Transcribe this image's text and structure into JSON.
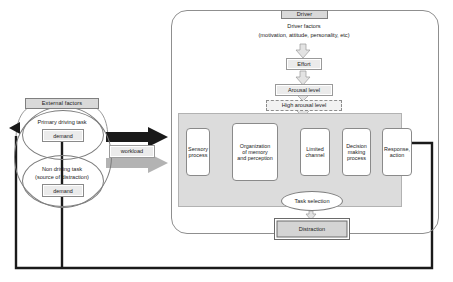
{
  "diagram": {
    "left": {
      "external_factors_label": "External factors",
      "primary_task_label": "Primary driving task",
      "primary_task_demand": "demand",
      "non_driving_task_label_line1": "Non driving task",
      "non_driving_task_label_line2": "(source of distraction)",
      "non_driving_task_demand": "demand"
    },
    "workload_label": "workload",
    "driver": {
      "header_label": "Driver",
      "factors_line1": "Driver factors",
      "factors_line2": "(motivation, attitude, personality, etc)",
      "effort_label": "Effort",
      "arousal_label": "Arousal level",
      "high_arousal_label": "High arousal level"
    },
    "process_chain": [
      {
        "id": "sensory-process",
        "line1": "Sensory",
        "line2": "process"
      },
      {
        "id": "organization-memory-perception",
        "line1": "Organization",
        "line2": "of memory",
        "line3": "and perception"
      },
      {
        "id": "limited-channel",
        "line1": "Limited",
        "line2": "channel"
      },
      {
        "id": "decision-making-process",
        "line1": "Decision",
        "line2": "making",
        "line3": "process"
      },
      {
        "id": "response-action",
        "line1": "Response,",
        "line2": "action"
      }
    ],
    "task_selection_label": "Task selection",
    "distraction_label": "Distraction",
    "colors": {
      "chip_fill": "#d9d9d9",
      "band_fill": "#dcdcdc",
      "black_arrow": "#1a1a1a",
      "gray_arrow": "#b3b3b3",
      "outline": "#8a8a8a"
    }
  }
}
